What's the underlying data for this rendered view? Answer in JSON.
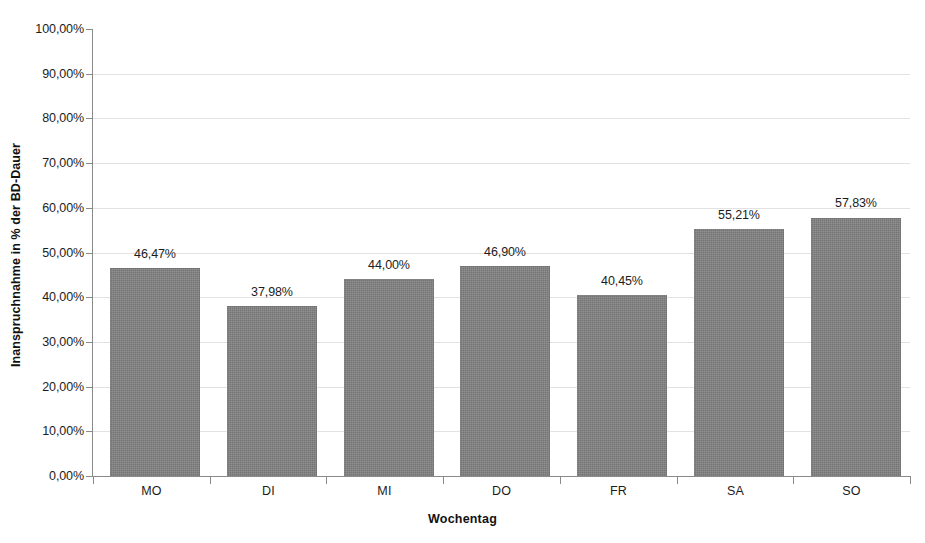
{
  "chart_data": {
    "type": "bar",
    "title": "",
    "xlabel": "Wochentag",
    "ylabel": "Inanspruchnahme in % der BD-Dauer",
    "categories": [
      "MO",
      "DI",
      "MI",
      "DO",
      "FR",
      "SA",
      "SO"
    ],
    "values": [
      46.47,
      37.98,
      44.0,
      46.9,
      40.45,
      55.21,
      57.83
    ],
    "data_labels": [
      "46,47%",
      "37,98%",
      "44,00%",
      "46,90%",
      "40,45%",
      "55,21%",
      "57,83%"
    ],
    "ylim": [
      0,
      100
    ],
    "ytick_values": [
      0,
      10,
      20,
      30,
      40,
      50,
      60,
      70,
      80,
      90,
      100
    ],
    "ytick_labels": [
      "0,00%",
      "10,00%",
      "20,00%",
      "30,00%",
      "40,00%",
      "50,00%",
      "60,00%",
      "70,00%",
      "80,00%",
      "90,00%",
      "100,00%"
    ],
    "grid": true,
    "legend": false,
    "bar_color": "#808080",
    "grid_color": "#e2e2e2",
    "axis_color": "#8a8a8a",
    "text_color": "#1c1c1c",
    "background": "#ffffff"
  }
}
